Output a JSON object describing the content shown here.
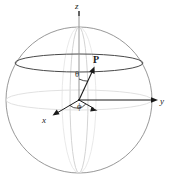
{
  "figure": {
    "width": 179,
    "height": 180,
    "background": "#ffffff",
    "labels": {
      "z_axis": "z",
      "y_axis": "y",
      "x_axis": "x",
      "point": "P",
      "polar_angle": "θ",
      "azimuth_angle": "ϕ"
    },
    "colors": {
      "sphere_outline": "#8c8c8c",
      "latitude_circle": "#3a3a3a",
      "equator": "#d9d9d9",
      "back_meridian": "#e0e0e0",
      "front_meridian": "#b5b5b5",
      "z_axis_line": "#8a8a8a",
      "vector": "#1a1a1a",
      "axis_line": "#1a1a1a",
      "label_text": "#1a1a1a"
    },
    "geometry": {
      "center_x": 79,
      "center_y": 100,
      "sphere_radius_x": 73,
      "sphere_radius_y": 73,
      "latitude_circle_cy": 63,
      "latitude_circle_rx": 64,
      "latitude_circle_ry": 9,
      "equator_rx": 73,
      "equator_ry": 10,
      "z_axis_top_y": 11,
      "y_axis_tip_x": 158,
      "x_axis_tip_x": 53,
      "x_axis_tip_y": 115,
      "vector_tip_x": 94,
      "vector_tip_y": 68,
      "projection_tip_x": 97,
      "projection_tip_y": 110
    }
  }
}
